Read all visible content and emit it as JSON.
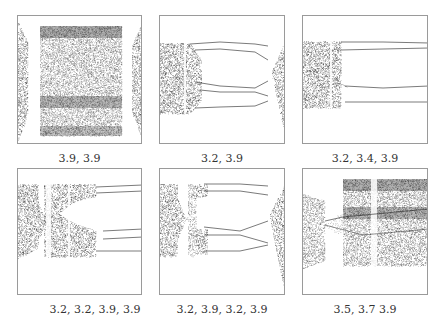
{
  "figure": {
    "panels": [
      {
        "id": "p1",
        "caption": "3.9, 3.9",
        "sequence": [
          3.9,
          3.9
        ]
      },
      {
        "id": "p2",
        "caption": "3.2, 3.9",
        "sequence": [
          3.2,
          3.9
        ]
      },
      {
        "id": "p3",
        "caption": "3.2, 3.4, 3.9",
        "sequence": [
          3.2,
          3.4,
          3.9
        ]
      },
      {
        "id": "p4",
        "caption": "3.2, 3.2, 3.9, 3.9",
        "sequence": [
          3.2,
          3.2,
          3.9,
          3.9
        ]
      },
      {
        "id": "p5",
        "caption": "3.2, 3.9, 3.2, 3.9",
        "sequence": [
          3.2,
          3.9,
          3.2,
          3.9
        ]
      },
      {
        "id": "p6",
        "caption": "3.5, 3.7 3.9",
        "sequence": [
          3.5,
          3.7,
          3.9
        ]
      }
    ],
    "colors": {
      "ink": "#1a1a1a",
      "frame": "#9a9a9a",
      "caption": "#333333"
    }
  }
}
